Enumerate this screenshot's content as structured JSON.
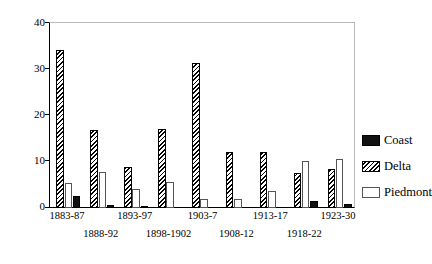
{
  "chart_data": {
    "type": "bar",
    "title": "",
    "xlabel": "",
    "ylabel": "",
    "ylim": [
      0,
      40
    ],
    "yticks": [
      0,
      10,
      20,
      30,
      40
    ],
    "grid": false,
    "legend_position": "right",
    "categories": [
      "1883-87",
      "1888-92",
      "1893-97",
      "1898-1902",
      "1903-7",
      "1908-12",
      "1913-17",
      "1918-22",
      "1923-30"
    ],
    "series": [
      {
        "name": "Coast",
        "color": "#111111",
        "values": [
          2.6,
          0.7,
          0.5,
          0.0,
          0.0,
          0.0,
          0.0,
          1.6,
          0.8
        ]
      },
      {
        "name": "Delta",
        "color": "#000000",
        "values": [
          34.0,
          16.8,
          8.8,
          16.9,
          31.2,
          12.0,
          12.0,
          7.6,
          8.4
        ]
      },
      {
        "name": "Piedmont",
        "color": "#ffffff",
        "values": [
          5.3,
          7.8,
          4.0,
          5.6,
          2.0,
          2.0,
          3.6,
          10.2,
          10.6
        ]
      }
    ]
  },
  "axis": {
    "y_tick_labels": [
      "40",
      "30",
      "20",
      "10",
      "0"
    ]
  },
  "x_axis": {
    "row1": [
      "1883-87",
      "1893-97",
      "1903-7",
      "1913-17",
      "1923-30"
    ],
    "row2": [
      "1888-92",
      "1898-1902",
      "1908-12",
      "1918-22"
    ]
  },
  "legend": {
    "items": [
      {
        "label": "Coast",
        "swatch": "solid-black-swatch"
      },
      {
        "label": "Delta",
        "swatch": "hatched-swatch"
      },
      {
        "label": "Piedmont",
        "swatch": "white-swatch"
      }
    ]
  }
}
